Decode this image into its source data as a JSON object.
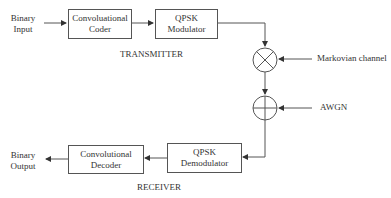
{
  "transmitter": {
    "section_label": "TRANSMITTER",
    "input_label": [
      "Binary",
      "Input"
    ],
    "coder": [
      "Convoluational",
      "Coder"
    ],
    "modulator": [
      "QPSK",
      "Modulator"
    ]
  },
  "channel": {
    "multiplier_symbol": "multiply-circle",
    "multiplier_input": "Markovian channel",
    "adder_symbol": "sum-circle",
    "adder_input": "AWGN"
  },
  "receiver": {
    "section_label": "RECEIVER",
    "demodulator": [
      "QPSK",
      "Demodulator"
    ],
    "decoder": [
      "Convolutional",
      "Decoder"
    ],
    "output_label": [
      "Binary",
      "Output"
    ]
  },
  "colors": {
    "line": "#555555",
    "text": "#333333",
    "background": "#ffffff"
  }
}
